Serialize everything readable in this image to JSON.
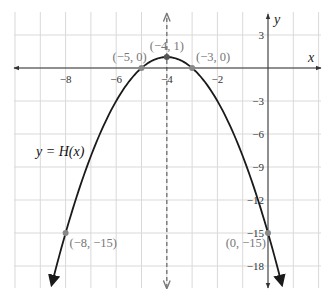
{
  "chart_data": {
    "type": "line",
    "title": "",
    "xlabel": "x",
    "ylabel": "y",
    "function_label": "y = H(x)",
    "function": "H(x) = -(x+4)^2 + 1",
    "xlim": [
      -10.1,
      2.1
    ],
    "ylim": [
      -20,
      5
    ],
    "grid": true,
    "x_ticks": [
      {
        "value": -8,
        "label": "−8"
      },
      {
        "value": -6,
        "label": "−6"
      },
      {
        "value": -4,
        "label": "−4"
      },
      {
        "value": -2,
        "label": "−2"
      }
    ],
    "y_ticks": [
      {
        "value": 3,
        "label": "3"
      },
      {
        "value": -3,
        "label": "−3"
      },
      {
        "value": -6,
        "label": "−6"
      },
      {
        "value": -9,
        "label": "−9"
      },
      {
        "value": -12,
        "label": "−12"
      },
      {
        "value": -15,
        "label": "−15"
      },
      {
        "value": -18,
        "label": "−18"
      }
    ],
    "axis_of_symmetry": {
      "x": -4,
      "style": "dashed"
    },
    "points": [
      {
        "x": -5,
        "y": 0,
        "label": "(−5, 0)"
      },
      {
        "x": -4,
        "y": 1,
        "label": "(−4, 1)"
      },
      {
        "x": -3,
        "y": 0,
        "label": "(−3, 0)"
      },
      {
        "x": -8,
        "y": -15,
        "label": "(−8, −15)"
      },
      {
        "x": 0,
        "y": -15,
        "label": "(0, −15)"
      }
    ],
    "colors": {
      "curve": "#1a1a1a",
      "axes": "#333333",
      "grid": "#d9d9d9",
      "points": "#888888",
      "dashed": "#777777"
    }
  }
}
